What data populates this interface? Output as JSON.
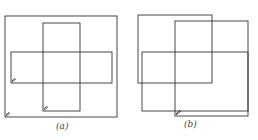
{
  "figure_a": {
    "label": "(a)",
    "rects": [
      {
        "name": "outer-square",
        "x": 5,
        "y": 16,
        "w": 112,
        "h": 101
      },
      {
        "name": "vertical-bar",
        "x": 43,
        "y": 23,
        "w": 37,
        "h": 88
      },
      {
        "name": "horizontal-bar",
        "x": 11,
        "y": 52,
        "w": 101,
        "h": 31
      }
    ]
  },
  "figure_b": {
    "label": "(b)",
    "rects": [
      {
        "name": "top-left-rect",
        "x": 138,
        "y": 15,
        "w": 74,
        "h": 68
      },
      {
        "name": "tall-rect",
        "x": 175,
        "y": 21,
        "w": 73,
        "h": 95
      },
      {
        "name": "horizontal-rect",
        "x": 142,
        "y": 52,
        "w": 106,
        "h": 59
      }
    ]
  },
  "colors": {
    "stroke": "#333333",
    "background": "#ffffff"
  }
}
